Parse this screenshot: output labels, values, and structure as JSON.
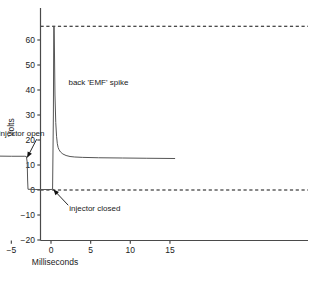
{
  "chart_data": {
    "type": "line",
    "title": "",
    "xlabel": "Milliseconds",
    "ylabel": "Volts",
    "xlim": [
      -16.2,
      15.8
    ],
    "ylim": [
      -20,
      68
    ],
    "xticks": [
      -15,
      -10,
      -5,
      0,
      5,
      10,
      15
    ],
    "xtick_labels": [
      "−15",
      "−10",
      "−5",
      "0",
      "5",
      "10",
      "15"
    ],
    "yticks": [
      -20,
      -10,
      0,
      10,
      20,
      30,
      40,
      50,
      60
    ],
    "ytick_labels": [
      "−20",
      "−10",
      "0",
      "10",
      "20",
      "30",
      "40",
      "50",
      "60"
    ],
    "grid": false,
    "legend": "none",
    "reference_lines": [
      {
        "name": "top-dashed-line",
        "axis": "horizontal",
        "value": 65.5,
        "style": "dashed"
      },
      {
        "name": "zero-dashed-line",
        "axis": "horizontal",
        "value": 0,
        "style": "dashed"
      }
    ],
    "series": [
      {
        "name": "injector-coil-voltage",
        "color": "#555555",
        "x": [
          -16.2,
          -12.0,
          -8.0,
          -5.0,
          -3.3,
          -3.1,
          -3.0,
          -2.95,
          -2.9,
          -2.0,
          -1.0,
          0.0,
          0.2,
          0.3,
          0.35,
          0.4,
          0.45,
          0.5,
          0.6,
          0.7,
          0.8,
          0.9,
          1.0,
          1.2,
          1.5,
          1.9,
          2.4,
          3.0,
          4.0,
          6.0,
          9.0,
          12.0,
          15.6
        ],
        "y": [
          13.7,
          13.6,
          13.6,
          13.5,
          13.5,
          13.4,
          11.0,
          4.0,
          0.3,
          0.2,
          0.2,
          0.2,
          0.3,
          30.0,
          65.5,
          65.5,
          52.0,
          38.0,
          27.0,
          21.5,
          18.5,
          17.0,
          16.2,
          15.2,
          14.4,
          13.8,
          13.4,
          13.2,
          13.05,
          12.9,
          12.8,
          12.7,
          12.6
        ]
      }
    ],
    "annotations": [
      {
        "name": "injector-open",
        "text": "injector open",
        "text_x": -6.6,
        "text_y": 21.5,
        "point_x": -3.0,
        "point_y": 13.0
      },
      {
        "name": "back-emf-spike",
        "text": "back 'EMF' spike",
        "text_x": 2.2,
        "text_y": 42.0,
        "point_x": null,
        "point_y": null
      },
      {
        "name": "injector-closed",
        "text": "injector closed",
        "text_x": 2.3,
        "text_y": -8.5,
        "point_x": 0.3,
        "point_y": 0.2
      }
    ]
  }
}
